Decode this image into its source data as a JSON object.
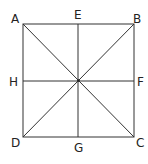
{
  "diagram": {
    "type": "square-with-diagonals-and-midlines",
    "stroke_color": "#333333",
    "labels": {
      "A": "A",
      "B": "B",
      "C": "C",
      "D": "D",
      "E": "E",
      "F": "F",
      "G": "G",
      "H": "H"
    },
    "points": {
      "A": [
        23,
        24
      ],
      "B": [
        134,
        24
      ],
      "C": [
        134,
        137
      ],
      "D": [
        23,
        137
      ],
      "E": [
        78,
        24
      ],
      "F": [
        134,
        81
      ],
      "G": [
        78,
        137
      ],
      "H": [
        23,
        81
      ]
    },
    "segments": [
      [
        "A",
        "B"
      ],
      [
        "B",
        "C"
      ],
      [
        "C",
        "D"
      ],
      [
        "D",
        "A"
      ],
      [
        "A",
        "C"
      ],
      [
        "B",
        "D"
      ],
      [
        "E",
        "G"
      ],
      [
        "H",
        "F"
      ]
    ]
  }
}
